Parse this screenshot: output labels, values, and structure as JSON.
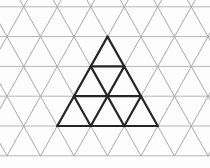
{
  "figure": {
    "canvas": {
      "width": 210,
      "height": 168,
      "background": "#fdfdfd"
    },
    "grid": {
      "color_horizontal": "#b6b6b6",
      "color_diagonal": "#a9a9a9",
      "stroke_width": 1,
      "unit": 33.5,
      "row_height": 29.8,
      "slope_dx_per_dy": 0.562,
      "x_min": 0,
      "x_max": 210,
      "y_min": 0,
      "y_max": 155.8,
      "horizontal_y": [
        6.8,
        36.6,
        66.4,
        96.2,
        126.0,
        155.8
      ],
      "diag_up_x0": [
        27.6,
        61.1,
        94.6,
        128.1,
        161.6,
        195.1,
        228.6,
        262.1,
        295.6
      ],
      "diag_down_x0": [
        -80.6,
        -47.1,
        -13.6,
        19.9,
        53.4,
        86.9,
        120.4,
        153.9,
        187.4
      ]
    },
    "bold_triangle": {
      "color": "#252525",
      "stroke_width": 2.2,
      "apex": [
        107.5,
        36.6
      ],
      "base_y": 126.0,
      "rows": 3,
      "segments": [
        [
          107.5,
          36.6,
          57.25,
          126.0
        ],
        [
          107.5,
          36.6,
          157.75,
          126.0
        ],
        [
          57.25,
          126.0,
          157.75,
          126.0
        ],
        [
          90.75,
          66.4,
          124.25,
          66.4
        ],
        [
          74.0,
          96.2,
          141.0,
          96.2
        ],
        [
          90.75,
          66.4,
          124.25,
          126.0
        ],
        [
          74.0,
          96.2,
          90.75,
          126.0
        ],
        [
          124.25,
          66.4,
          90.75,
          126.0
        ],
        [
          141.0,
          96.2,
          124.25,
          126.0
        ]
      ]
    }
  }
}
